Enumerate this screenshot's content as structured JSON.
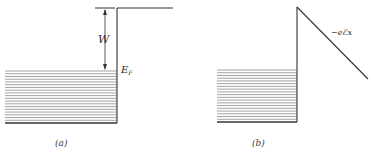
{
  "figure": {
    "panels": [
      {
        "id": "a",
        "caption": "(a)",
        "labels": {
          "work_function": "W",
          "fermi_level_main": "E",
          "fermi_level_sub": "F"
        },
        "filled_levels_count": 19
      },
      {
        "id": "b",
        "caption": "(b)",
        "labels": {
          "field_potential": "−eℰx"
        },
        "filled_levels_count": 19
      }
    ],
    "colors": {
      "line": "#333333",
      "levels": "#888888",
      "background": "#ffffff"
    }
  }
}
